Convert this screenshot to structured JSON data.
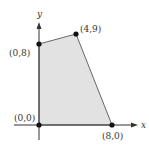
{
  "figure": {
    "type": "feasible-region",
    "axes": {
      "x_label": "x",
      "y_label": "y"
    },
    "vertices": [
      {
        "label": "(0,0)",
        "x": 0,
        "y": 0
      },
      {
        "label": "(8,0)",
        "x": 8,
        "y": 0
      },
      {
        "label": "(4,9)",
        "x": 4,
        "y": 9
      },
      {
        "label": "(0,8)",
        "x": 0,
        "y": 8
      }
    ],
    "colors": {
      "region_fill": "#e2e2e2",
      "edge": "#666666",
      "axis": "#333333",
      "point": "#111111"
    }
  }
}
